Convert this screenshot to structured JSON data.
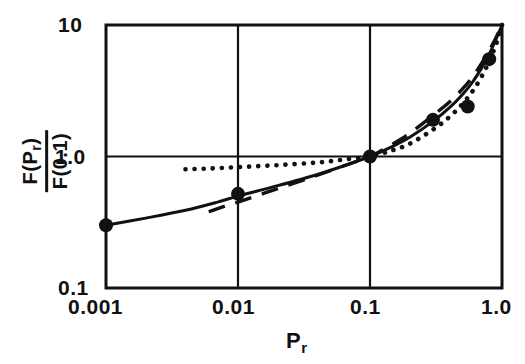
{
  "chart_data": {
    "type": "line",
    "title": "",
    "subtitle": "",
    "xlabel": "P_r",
    "xlabel_base": "P",
    "xlabel_sub": "r",
    "ylabel": "F(P_r) / F(0.1)",
    "ylabel_numerator": "F(P",
    "ylabel_numerator_sub": "r",
    "ylabel_numerator_tail": ")",
    "ylabel_denominator": "F(0.1)",
    "xscale": "log",
    "yscale": "log",
    "xlim": [
      0.001,
      1.0
    ],
    "ylim": [
      0.1,
      10
    ],
    "grid": true,
    "legend": "none",
    "xticks": [
      0.001,
      0.01,
      0.1,
      1.0
    ],
    "xticklabels": [
      "0.001",
      "0.01",
      "0.1",
      "1.0"
    ],
    "yticks": [
      0.1,
      1.0,
      10
    ],
    "yticklabels": [
      "0.1",
      "1.0",
      "10"
    ],
    "gridlines_x": [
      0.01,
      0.1
    ],
    "gridlines_y": [
      1.0
    ],
    "series": [
      {
        "name": "solid-curve",
        "style": "solid",
        "color": "#111111",
        "x": [
          0.001,
          0.002,
          0.004,
          0.007,
          0.01,
          0.02,
          0.04,
          0.07,
          0.1,
          0.15,
          0.2,
          0.3,
          0.4,
          0.5,
          0.6,
          0.7,
          0.8,
          0.9,
          1.0
        ],
        "y": [
          0.3,
          0.34,
          0.39,
          0.45,
          0.5,
          0.6,
          0.73,
          0.88,
          1.0,
          1.2,
          1.4,
          1.85,
          2.35,
          2.95,
          3.7,
          4.7,
          6.0,
          7.8,
          10.0
        ]
      },
      {
        "name": "dashed-curve",
        "style": "dashed",
        "color": "#111111",
        "x": [
          0.006,
          0.008,
          0.01,
          0.02,
          0.04,
          0.07,
          0.1,
          0.15,
          0.2,
          0.3,
          0.4,
          0.5,
          0.6,
          0.7,
          0.8,
          0.9,
          1.0
        ],
        "y": [
          0.38,
          0.42,
          0.45,
          0.57,
          0.72,
          0.88,
          1.0,
          1.25,
          1.5,
          2.05,
          2.6,
          3.25,
          4.05,
          5.1,
          6.4,
          8.0,
          10.0
        ]
      },
      {
        "name": "dotted-curve",
        "style": "dotted",
        "color": "#111111",
        "x": [
          0.004,
          0.006,
          0.01,
          0.02,
          0.04,
          0.07,
          0.1,
          0.15,
          0.2,
          0.3,
          0.4,
          0.5,
          0.6,
          0.7,
          0.8,
          0.9,
          1.0
        ],
        "y": [
          0.8,
          0.81,
          0.83,
          0.86,
          0.9,
          0.96,
          1.0,
          1.12,
          1.25,
          1.6,
          2.0,
          2.5,
          3.15,
          4.05,
          5.3,
          7.1,
          10.0
        ]
      }
    ],
    "points": {
      "name": "data-points",
      "marker": "filled-circle",
      "color": "#111111",
      "x": [
        0.001,
        0.01,
        0.1,
        0.3,
        0.55,
        0.8
      ],
      "y": [
        0.3,
        0.52,
        1.0,
        1.9,
        2.4,
        5.5
      ]
    }
  }
}
